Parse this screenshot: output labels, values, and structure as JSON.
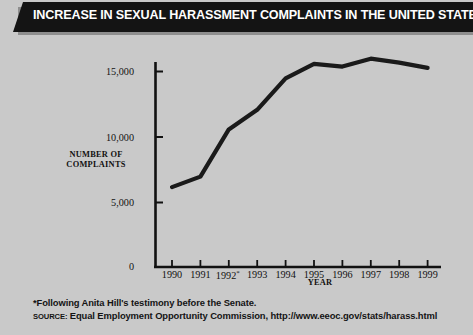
{
  "banner": {
    "title": "INCREASE IN SEXUAL HARASSMENT COMPLAINTS IN THE UNITED STATES,  1990–99"
  },
  "axes": {
    "ylabel_line1": "NUMBER OF",
    "ylabel_line2": "COMPLAINTS",
    "ylabel": "NUMBER OF COMPLAINTS",
    "xlabel": "YEAR",
    "yticks": [
      "15,000",
      "10,000",
      "5,000",
      "0"
    ],
    "xticks": [
      "1990",
      "1991",
      "1992",
      "1993",
      "1994",
      "1995",
      "1996",
      "1997",
      "1998",
      "1999"
    ],
    "xtick_asterisk_index": 2,
    "asterisk": "*"
  },
  "footnotes": {
    "note": "*Following Anita Hill's testimony before the Senate.",
    "source_keyword": "SOURCE:",
    "source_rest": " Equal Employment Opportunity Commission, http://www.eeoc.gov/stats/harass.html",
    "source_full": "SOURCE: Equal Employment Opportunity Commission, http://www.eeoc.gov/stats/harass.html"
  },
  "colors": {
    "background": "#c9c9c9",
    "banner": "#141414",
    "banner_text": "#ffffff",
    "line": "#1a1a1a",
    "axis": "#111111",
    "text": "#111111"
  },
  "chart_data": {
    "type": "line",
    "title": "INCREASE IN SEXUAL HARASSMENT COMPLAINTS IN THE UNITED STATES, 1990–99",
    "xlabel": "YEAR",
    "ylabel": "NUMBER OF COMPLAINTS",
    "categories": [
      "1990",
      "1991",
      "1992",
      "1993",
      "1994",
      "1995",
      "1996",
      "1997",
      "1998",
      "1999"
    ],
    "values": [
      6100,
      6900,
      10500,
      12000,
      14400,
      15500,
      15300,
      15900,
      15600,
      15200
    ],
    "series": [
      {
        "name": "Sexual harassment complaints",
        "values": [
          6100,
          6900,
          10500,
          12000,
          14400,
          15500,
          15300,
          15900,
          15600,
          15200
        ]
      }
    ],
    "ylim": [
      0,
      16500
    ],
    "yticks": [
      0,
      5000,
      10000,
      15000
    ],
    "ytick_labels": [
      "0",
      "5,000",
      "10,000",
      "15,000"
    ],
    "grid": false,
    "legend": "none",
    "annotations": [
      "*Following Anita Hill's testimony before the Senate."
    ],
    "source": "Equal Employment Opportunity Commission, http://www.eeoc.gov/stats/harass.html"
  }
}
